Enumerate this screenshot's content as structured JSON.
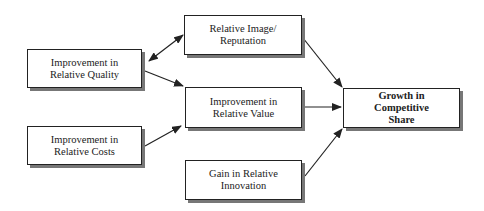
{
  "diagram": {
    "type": "flow",
    "nodes": [
      {
        "id": "quality",
        "line1": "Improvement in",
        "line2": "Relative Quality"
      },
      {
        "id": "image",
        "line1": "Relative Image/",
        "line2": "Reputation"
      },
      {
        "id": "value",
        "line1": "Improvement in",
        "line2": "Relative Value"
      },
      {
        "id": "costs",
        "line1": "Improvement in",
        "line2": "Relative Costs"
      },
      {
        "id": "innovation",
        "line1": "Gain in Relative",
        "line2": "Innovation"
      },
      {
        "id": "growth",
        "line1": "Growth in",
        "line2": "Competitive",
        "line3": "Share"
      }
    ],
    "edges": [
      {
        "from": "quality",
        "to": "image",
        "bidirectional": true
      },
      {
        "from": "quality",
        "to": "value"
      },
      {
        "from": "costs",
        "to": "value"
      },
      {
        "from": "image",
        "to": "growth"
      },
      {
        "from": "value",
        "to": "growth"
      },
      {
        "from": "innovation",
        "to": "growth"
      }
    ]
  }
}
